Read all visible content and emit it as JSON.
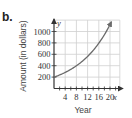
{
  "part_label": "b.",
  "chart_data": {
    "type": "line",
    "title": "",
    "xlabel": "Year",
    "ylabel": "Amount (in dollars)",
    "x_var": "x",
    "y_var": "y",
    "x_ticks": [
      4,
      8,
      12,
      16,
      20
    ],
    "x_tick_labels": [
      "4",
      "8",
      "12",
      "16",
      "20"
    ],
    "y_ticks": [
      200,
      400,
      600,
      800,
      1000
    ],
    "y_tick_labels": [
      "200",
      "400",
      "600",
      "800",
      "1000"
    ],
    "xlim": [
      0,
      23.5
    ],
    "ylim": [
      0,
      1200
    ],
    "grid": true,
    "series": [
      {
        "name": "Amount",
        "x": [
          0,
          4,
          8,
          12,
          16,
          20
        ],
        "values": [
          200,
          282,
          398,
          563,
          794,
          1121
        ],
        "arrow_end": true
      }
    ],
    "colors": {
      "curve": "#6b6b6b",
      "grid": "#cfcfcf",
      "axis": "#333333"
    }
  }
}
